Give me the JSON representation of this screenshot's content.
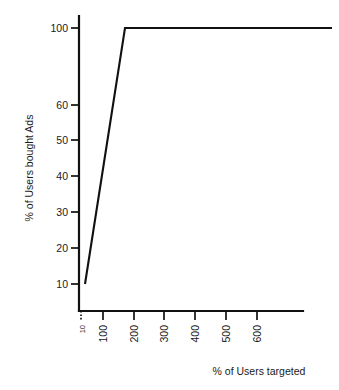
{
  "chart_data": {
    "type": "line",
    "title": "",
    "xlabel": "% of Users targeted",
    "ylabel": "% of Users bought Ads",
    "x": [
      10,
      170,
      750
    ],
    "values": [
      10,
      100,
      100
    ],
    "series": [
      {
        "name": "% of Users bought Ads",
        "x": [
          10,
          170,
          750
        ],
        "values": [
          10,
          100,
          100
        ]
      }
    ],
    "x_tick_labels": [
      "10",
      "100",
      "200",
      "300",
      "400",
      "500",
      "600"
    ],
    "x_tick_values": [
      10,
      100,
      200,
      300,
      400,
      500,
      600
    ],
    "y_tick_labels": [
      "100",
      "60",
      "50",
      "40",
      "30",
      "20",
      "10"
    ],
    "y_tick_values": [
      100,
      60,
      50,
      40,
      30,
      20,
      10
    ],
    "xlim": [
      0,
      760
    ],
    "ylim": [
      0,
      100
    ],
    "grid": false,
    "legend": "none",
    "line_color": "#111111",
    "background_color": "#ffffff",
    "axis_color": "#111111"
  },
  "axes": {
    "y_title": "% of Users bought Ads",
    "x_title": "% of Users targeted",
    "y_ticks": [
      {
        "label": "100",
        "y": 28
      },
      {
        "label": "60",
        "y": 105
      },
      {
        "label": "50",
        "y": 140
      },
      {
        "label": "40",
        "y": 176
      },
      {
        "label": "30",
        "y": 212
      },
      {
        "label": "20",
        "y": 248
      },
      {
        "label": "10",
        "y": 284
      }
    ],
    "x_ticks": [
      {
        "label": "10",
        "x": 81,
        "style": "dotted",
        "size": "small"
      },
      {
        "label": "100",
        "x": 103,
        "style": "solid",
        "size": "normal"
      },
      {
        "label": "200",
        "x": 134,
        "style": "solid",
        "size": "normal"
      },
      {
        "label": "300",
        "x": 164,
        "style": "solid",
        "size": "normal"
      },
      {
        "label": "400",
        "x": 195,
        "style": "solid",
        "size": "normal"
      },
      {
        "label": "500",
        "x": 226,
        "style": "solid",
        "size": "normal"
      },
      {
        "label": "600",
        "x": 257,
        "style": "solid",
        "size": "normal"
      }
    ]
  },
  "plot": {
    "y_axis_x": 79,
    "y_axis_top": 16,
    "y_axis_bottom": 311,
    "x_axis_y": 311,
    "x_axis_left": 79,
    "x_axis_right": 303,
    "line_points": "85,284 125,28 332,28"
  }
}
